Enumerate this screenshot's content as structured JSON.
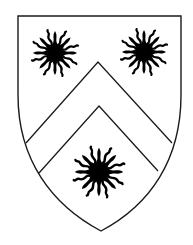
{
  "image": {
    "subject": "heraldic shield: argent, a chevron between three suns in splendour sable",
    "colors": {
      "field": "#ffffff",
      "charge": "#000000",
      "outline": "#1a1a1a"
    },
    "charges": [
      {
        "name": "sun-in-splendour",
        "cx": 55,
        "cy": 53,
        "r": 23
      },
      {
        "name": "sun-in-splendour",
        "cx": 144,
        "cy": 52,
        "r": 23
      },
      {
        "name": "sun-in-splendour",
        "cx": 99,
        "cy": 172,
        "r": 25
      }
    ],
    "ordinary": "chevron"
  }
}
